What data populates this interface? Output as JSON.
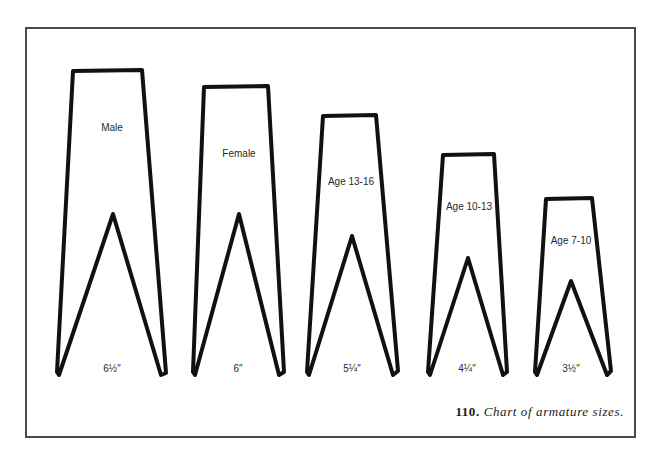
{
  "figure": {
    "number": "110.",
    "caption": "Chart of armature sizes."
  },
  "armatures": [
    {
      "name": "Male",
      "size": "6½″"
    },
    {
      "name": "Female",
      "size": "6″"
    },
    {
      "name": "Age 13-16",
      "size": "5¼″"
    },
    {
      "name": "Age 10-13",
      "size": "4¼″"
    },
    {
      "name": "Age 7-10",
      "size": "3½″"
    }
  ],
  "colors": {
    "outline": "#111111",
    "frame": "#4a4a4a",
    "background": "#ffffff"
  }
}
